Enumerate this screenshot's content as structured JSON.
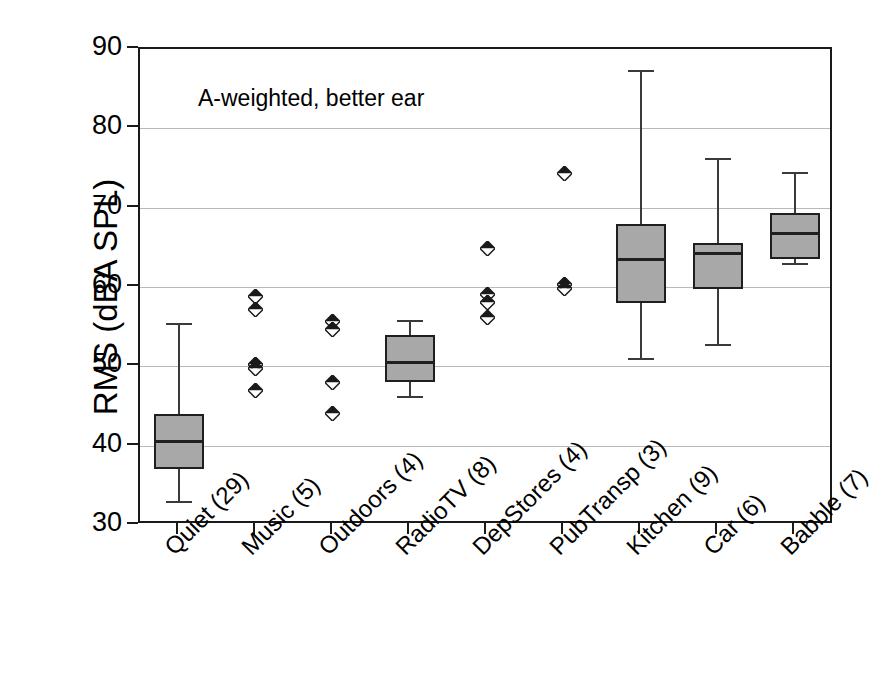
{
  "chart_data": {
    "type": "box",
    "title": "",
    "annotation": "A-weighted, better ear",
    "xlabel": "",
    "ylabel": "RMS (dBA SPL)",
    "ylim": [
      30,
      90
    ],
    "ytick_step": 10,
    "yticks": [
      30,
      40,
      50,
      60,
      70,
      80,
      90
    ],
    "ytick_labels": [
      "30",
      "40",
      "50",
      "60",
      "70",
      "80",
      "90"
    ],
    "grid": "horizontal",
    "legend": "none",
    "categories": [
      "Quiet (29)",
      "Music (5)",
      "Outdoors (4)",
      "RadioTV (8)",
      "DepStores (4)",
      "PubTransp (3)",
      "Kitchen (9)",
      "Car (6)",
      "Babble (7)"
    ],
    "category_counts": [
      29,
      5,
      4,
      8,
      4,
      3,
      9,
      6,
      7
    ],
    "marker_style": "diamond-half-filled",
    "box_fill_color": "#a8a8a8",
    "box_edge_color": "#1f1f1f",
    "series": [
      {
        "name": "Quiet (29)",
        "render": "box",
        "whisker_low": 33.0,
        "q1": 37.0,
        "median": 40.5,
        "q3": 44.0,
        "whisker_high": 55.5
      },
      {
        "name": "Music (5)",
        "render": "points",
        "points": [
          58.8,
          57.2,
          50.2,
          49.7,
          47.0
        ]
      },
      {
        "name": "Outdoors (4)",
        "render": "points",
        "points": [
          55.6,
          54.6,
          48.0,
          44.0
        ]
      },
      {
        "name": "RadioTV (8)",
        "render": "box",
        "whisker_low": 46.3,
        "q1": 48.0,
        "median": 50.5,
        "q3": 54.0,
        "whisker_high": 55.8
      },
      {
        "name": "DepStores (4)",
        "render": "points",
        "points": [
          64.8,
          59.0,
          58.0,
          56.1
        ]
      },
      {
        "name": "PubTransp (3)",
        "render": "points",
        "points": [
          74.3,
          60.3,
          59.8
        ]
      },
      {
        "name": "Kitchen (9)",
        "render": "box",
        "whisker_low": 51.0,
        "q1": 58.0,
        "median": 63.5,
        "q3": 68.0,
        "whisker_high": 87.3
      },
      {
        "name": "Car (6)",
        "render": "box",
        "whisker_low": 52.8,
        "q1": 59.8,
        "median": 64.2,
        "q3": 65.5,
        "whisker_high": 76.3
      },
      {
        "name": "Babble (7)",
        "render": "box",
        "whisker_low": 63.0,
        "q1": 63.5,
        "median": 66.8,
        "q3": 69.3,
        "whisker_high": 74.5
      }
    ]
  }
}
